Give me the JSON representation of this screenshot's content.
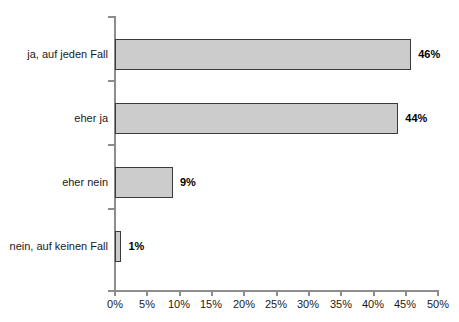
{
  "chart_data": {
    "type": "bar",
    "orientation": "horizontal",
    "title": "",
    "subtitle": "",
    "xlabel": "",
    "ylabel": "",
    "categories": [
      "ja, auf jeden Fall",
      "eher ja",
      "eher nein",
      "nein, auf keinen Fall"
    ],
    "values": [
      46,
      44,
      9,
      1
    ],
    "data_labels": [
      "46%",
      "44%",
      "9%",
      "1%"
    ],
    "xlim": [
      0,
      50
    ],
    "xtick_values": [
      0,
      5,
      10,
      15,
      20,
      25,
      30,
      35,
      40,
      45,
      50
    ],
    "xtick_labels": [
      "0%",
      "5%",
      "10%",
      "15%",
      "20%",
      "25%",
      "30%",
      "35%",
      "40%",
      "45%",
      "50%"
    ],
    "grid": false,
    "legend": null,
    "bar_fill_color": "#cccccc",
    "bar_border_color": "#3a3a3a",
    "axis_color": "#8d8d8d",
    "background_color": "#ffffff",
    "text_color": "#1a1a1a"
  }
}
